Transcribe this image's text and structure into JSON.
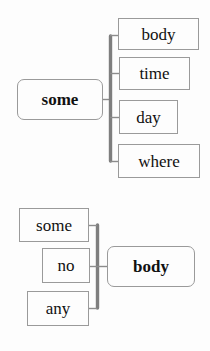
{
  "diagram": {
    "background_color": "#fdfdfd",
    "bracket_color": "#808080",
    "box_border_color": "#9a9a9a",
    "text_color": "#111111",
    "groups": [
      {
        "id": "group-top",
        "stem": {
          "label": "some",
          "style": "rounded",
          "emphasis": "bold",
          "side": "left"
        },
        "branches": [
          {
            "label": "body"
          },
          {
            "label": "time"
          },
          {
            "label": "day"
          },
          {
            "label": "where"
          }
        ],
        "bracket_side": "right"
      },
      {
        "id": "group-bottom",
        "stem": {
          "label": "body",
          "style": "rounded",
          "emphasis": "bold",
          "side": "right"
        },
        "branches": [
          {
            "label": "some"
          },
          {
            "label": "no"
          },
          {
            "label": "any"
          }
        ],
        "bracket_side": "left"
      }
    ]
  }
}
